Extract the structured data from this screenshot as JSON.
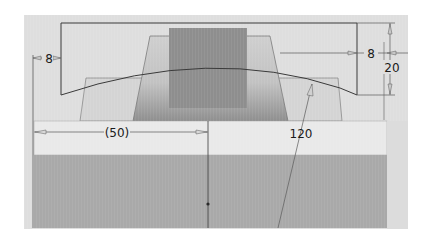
{
  "app": {
    "view": "CAD sketch viewport"
  },
  "colors": {
    "page_background": "#ffffff",
    "canvas_background": "#dedede",
    "light_band": "#e8e8e8",
    "base_block": "#a8a8a8",
    "center_block": "#8c8c8c",
    "trapezoid_outer": "#d6d6d6",
    "trapezoid_inner": "#cbcbcb",
    "sketch_line": "#3a3a3a",
    "dimension_line": "#5a5a5a",
    "dimension_text": "#1a1a1a"
  },
  "dimensions": [
    {
      "id": "left-offset",
      "label": "8"
    },
    {
      "id": "right-offset",
      "label": "8"
    },
    {
      "id": "height",
      "label": "20"
    },
    {
      "id": "width-reference",
      "label": "(50)"
    },
    {
      "id": "arc-radius",
      "label": "120"
    }
  ]
}
